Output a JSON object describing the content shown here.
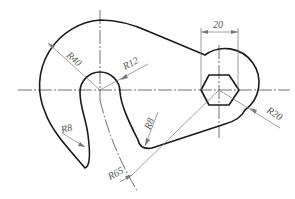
{
  "drawing": {
    "type": "hook-plate-engineering-drawing",
    "dimensions": {
      "r40": "R40",
      "r12": "R12",
      "r8_left": "R8",
      "r8_right": "R8",
      "r65": "R65",
      "r20": "R20",
      "width_20": "20"
    },
    "colors": {
      "outline": "#1a1a1a",
      "centerline": "#333333",
      "dimension": "#777777",
      "text": "#555555",
      "background": "#ffffff"
    }
  }
}
